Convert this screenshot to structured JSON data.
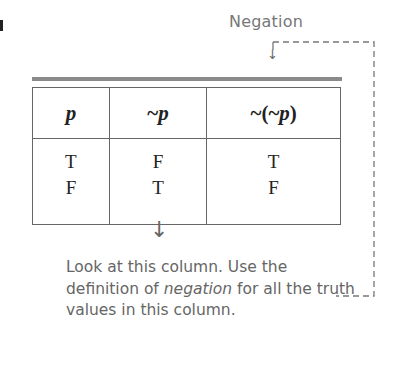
{
  "callout": {
    "label": "Negation",
    "arrow_glyph": "↓"
  },
  "table": {
    "headers": [
      {
        "prefix": "",
        "var": "p",
        "suffix": ""
      },
      {
        "prefix": "~",
        "var": "p",
        "suffix": ""
      },
      {
        "prefix": "~(~",
        "var": "p",
        "suffix": ")"
      }
    ],
    "columns": [
      [
        "T",
        "F"
      ],
      [
        "F",
        "T"
      ],
      [
        "T",
        "F"
      ]
    ]
  },
  "note": {
    "arrow_glyph": "↓",
    "text_before": "Look at this column. Use the definition of ",
    "emphasis": "negation",
    "text_after": " for all the truth values in this column."
  },
  "colors": {
    "text_gray": "#666666",
    "bar_gray": "#8a8a8a",
    "border": "#666666"
  }
}
